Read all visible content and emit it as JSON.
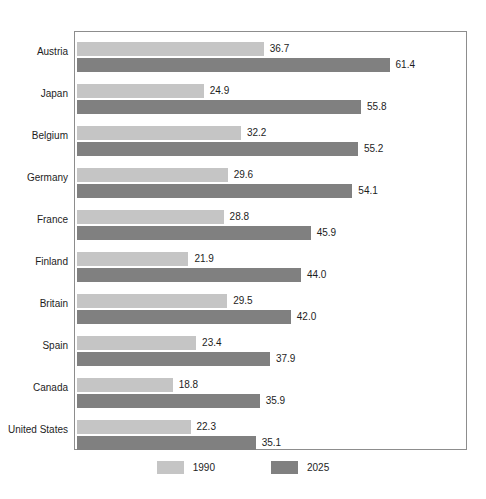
{
  "chart_data": {
    "type": "bar",
    "orientation": "horizontal",
    "title": "",
    "subtitle": "",
    "xlabel": "",
    "ylabel": "",
    "grid": false,
    "legend_position": "bottom",
    "xlim": [
      0,
      61.4
    ],
    "categories": [
      "Austria",
      "Japan",
      "Belgium",
      "Germany",
      "France",
      "Finland",
      "Britain",
      "Spain",
      "Canada",
      "United States"
    ],
    "series": [
      {
        "name": "1990",
        "color": "#c5c5c5",
        "values": [
          36.7,
          24.9,
          32.2,
          29.6,
          28.8,
          21.9,
          29.5,
          23.4,
          18.8,
          22.3
        ],
        "labels": [
          "36.7",
          "24.9",
          "32.2",
          "29.6",
          "28.8",
          "21.9",
          "29.5",
          "23.4",
          "18.8",
          "22.3"
        ]
      },
      {
        "name": "2025",
        "color": "#808080",
        "values": [
          61.4,
          55.8,
          55.2,
          54.1,
          45.9,
          44.0,
          42.0,
          37.9,
          35.9,
          35.1
        ],
        "labels": [
          "61.4",
          "55.8",
          "55.2",
          "54.1",
          "45.9",
          "44.0",
          "42.0",
          "37.9",
          "35.9",
          "35.1"
        ]
      }
    ]
  },
  "legend": {
    "items": [
      {
        "label": "1990",
        "color": "#c5c5c5"
      },
      {
        "label": "2025",
        "color": "#808080"
      }
    ]
  },
  "colors": {
    "series_1990": "#c5c5c5",
    "series_2025": "#808080",
    "frame": "#8d8d8d",
    "background": "#ffffff",
    "text": "#1d1d1d"
  }
}
